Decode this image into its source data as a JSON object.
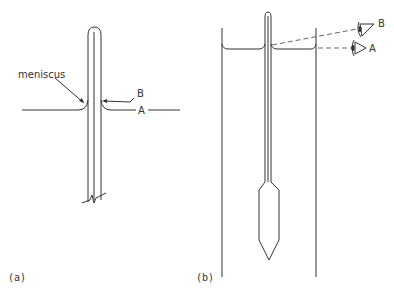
{
  "figure_a": {
    "caption": "(a)",
    "labels": {
      "meniscus": "meniscus",
      "B": "B",
      "A": "A"
    }
  },
  "figure_b": {
    "caption": "(b)",
    "labels": {
      "B": "B",
      "A": "A"
    },
    "icons": [
      "eye-icon-B",
      "eye-icon-A"
    ]
  }
}
